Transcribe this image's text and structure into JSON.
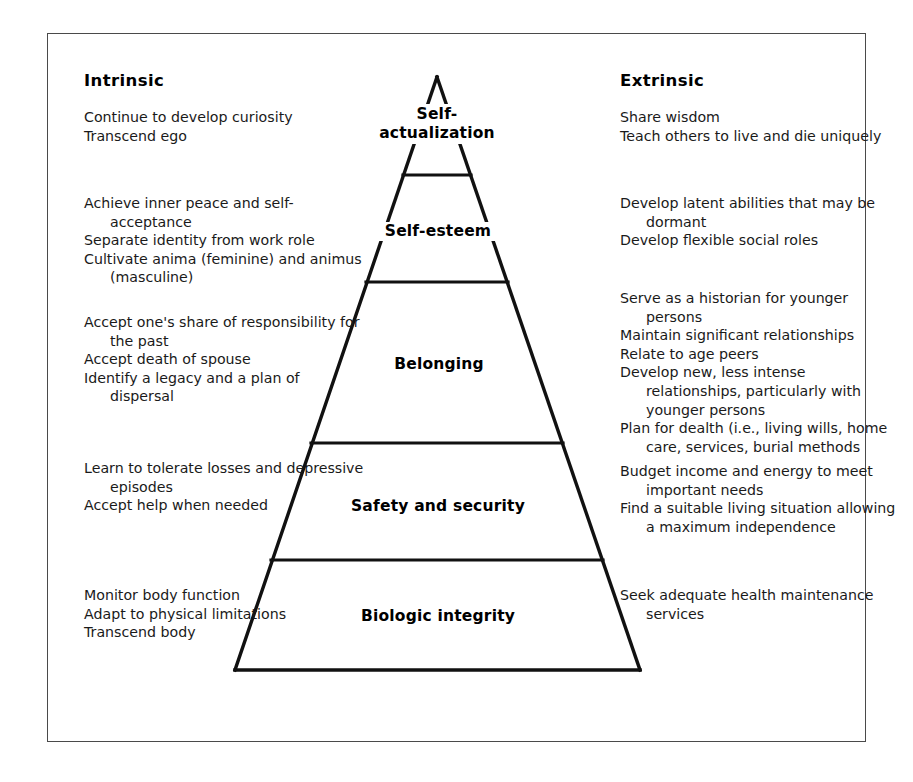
{
  "figure": {
    "columns": {
      "left_heading": "Intrinsic",
      "right_heading": "Extrinsic"
    },
    "colors": {
      "ink": "#000000",
      "frame": "#4a4a4a",
      "background": "#ffffff"
    }
  },
  "tiers": [
    {
      "id": "self-actualization",
      "label": "Self-\nactualization",
      "label_lines": [
        "Self-",
        "actualization"
      ],
      "intrinsic": [
        "Continue to develop curiosity",
        "Transcend ego"
      ],
      "extrinsic": [
        "Share wisdom",
        "Teach others to live and die uniquely"
      ]
    },
    {
      "id": "self-esteem",
      "label": "Self-esteem",
      "label_lines": [
        "Self-esteem"
      ],
      "intrinsic": [
        "Achieve inner peace and self-acceptance",
        "Separate identity from work role",
        "Cultivate anima (feminine) and animus (masculine)"
      ],
      "extrinsic": [
        "Develop latent abilities that may be dormant",
        "Develop flexible social roles"
      ]
    },
    {
      "id": "belonging",
      "label": "Belonging",
      "label_lines": [
        "Belonging"
      ],
      "intrinsic": [
        "Accept one's share of responsibility for the past",
        "Accept death of spouse",
        "Identify a legacy and a plan of dispersal"
      ],
      "extrinsic": [
        "Serve as a historian for younger persons",
        "Maintain significant relationships",
        "Relate to age peers",
        "Develop new, less intense relationships, particularly with younger persons",
        "Plan for dealth (i.e., living wills, home care, services, burial methods"
      ]
    },
    {
      "id": "safety-and-security",
      "label": "Safety and security",
      "label_lines": [
        "Safety and security"
      ],
      "intrinsic": [
        "Learn to tolerate losses and depressive episodes",
        "Accept help when needed"
      ],
      "extrinsic": [
        "Budget income and energy to meet important needs",
        "Find a suitable living situation allowing a maximum independence"
      ]
    },
    {
      "id": "biologic-integrity",
      "label": "Biologic integrity",
      "label_lines": [
        "Biologic integrity"
      ],
      "intrinsic": [
        "Monitor body function",
        "Adapt to physical limitations",
        "Transcend body"
      ],
      "extrinsic": [
        "Seek adequate health maintenance services"
      ]
    }
  ],
  "geometry": {
    "frame": {
      "x": 47,
      "y": 33,
      "width": 819,
      "height": 709
    },
    "apex": {
      "x": 437,
      "y": 77
    },
    "base": {
      "left_x": 235,
      "right_x": 640,
      "y": 670
    },
    "divider_y": [
      175,
      282,
      443,
      560
    ]
  }
}
